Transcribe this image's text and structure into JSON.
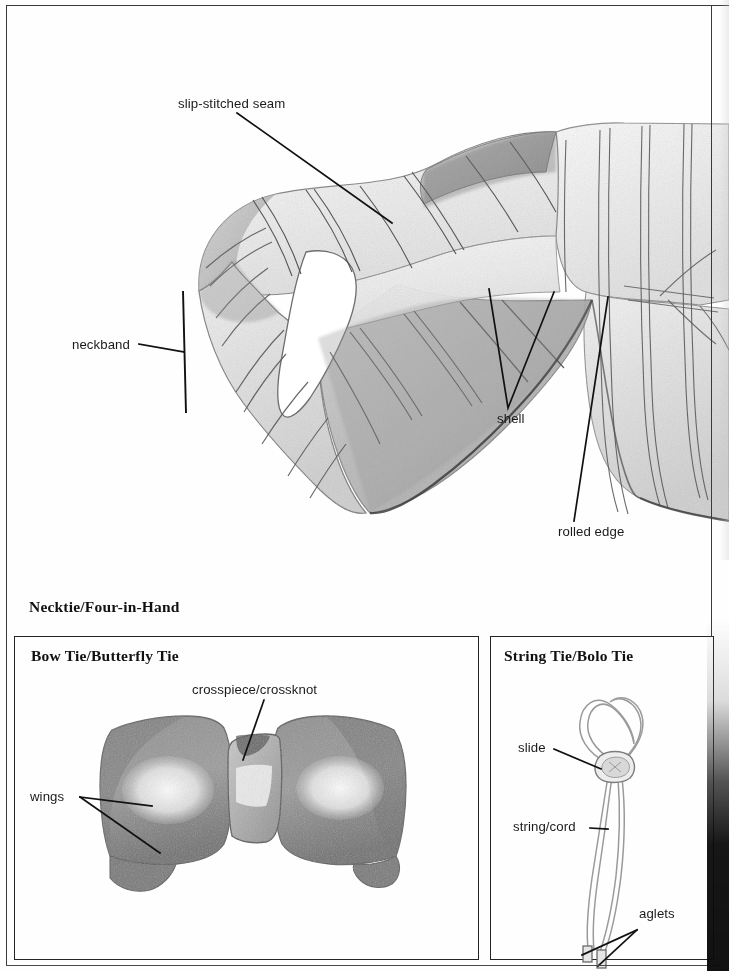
{
  "page": {
    "background_color": "#fefefe",
    "ink_color": "#1a1a1a"
  },
  "main_figure": {
    "name": "four-in-hand necktie",
    "caption": "Necktie/Four-in-Hand",
    "labels": [
      {
        "id": "slip-stitched-seam",
        "text": "slip-stitched seam"
      },
      {
        "id": "neckband",
        "text": "neckband"
      },
      {
        "id": "shell",
        "text": "shell"
      },
      {
        "id": "rolled-edge",
        "text": "rolled edge"
      }
    ]
  },
  "panels": [
    {
      "id": "bow-tie",
      "heading": "Bow Tie/Butterfly Tie",
      "labels": [
        {
          "id": "crosspiece",
          "text": "crosspiece/crossknot"
        },
        {
          "id": "wings",
          "text": "wings"
        }
      ]
    },
    {
      "id": "string-tie",
      "heading": "String Tie/Bolo Tie",
      "labels": [
        {
          "id": "slide",
          "text": "slide"
        },
        {
          "id": "string-cord",
          "text": "string/cord"
        },
        {
          "id": "aglets",
          "text": "aglets"
        }
      ]
    }
  ]
}
